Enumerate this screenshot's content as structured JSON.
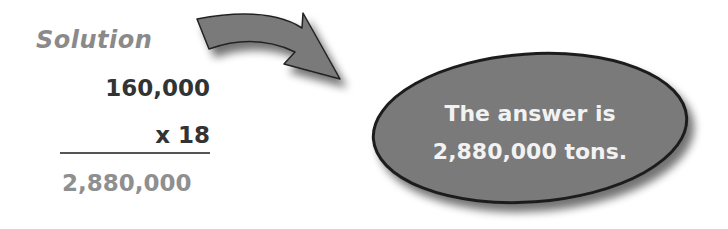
{
  "solution": {
    "label": "Solution",
    "multiplicand": "160,000",
    "multiplier": "x 18",
    "product": "2,880,000"
  },
  "answer_bubble": {
    "line1": "The answer is",
    "line2": "2,880,000 tons."
  },
  "colors": {
    "shape_fill": "#7a7a7a",
    "shape_stroke": "#222222",
    "label_gray": "#8a8a8a",
    "dark_text": "#333333",
    "bubble_text": "#f2f2f2"
  }
}
